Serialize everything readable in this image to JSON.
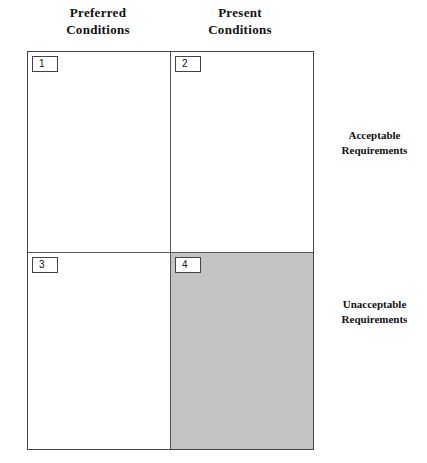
{
  "columns": [
    {
      "line1": "Preferred",
      "line2": "Conditions"
    },
    {
      "line1": "Present",
      "line2": "Conditions"
    }
  ],
  "rows": [
    {
      "line1": "Acceptable",
      "line2": "Requirements"
    },
    {
      "line1": "Unacceptable",
      "line2": "Requirements"
    }
  ],
  "cells": [
    {
      "number": "1",
      "shaded": false
    },
    {
      "number": "2",
      "shaded": false
    },
    {
      "number": "3",
      "shaded": false
    },
    {
      "number": "4",
      "shaded": true,
      "fill": "#c4c4c4"
    }
  ]
}
